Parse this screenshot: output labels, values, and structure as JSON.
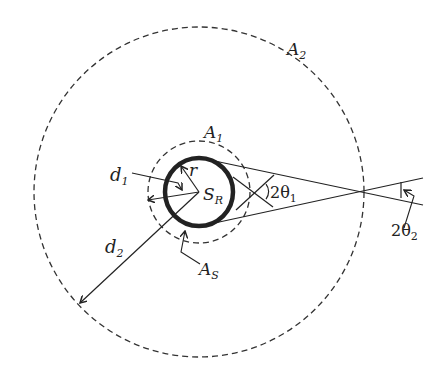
{
  "diagram": {
    "labels": {
      "A2": {
        "main": "A",
        "sub": "2"
      },
      "A1": {
        "main": "A",
        "sub": "1"
      },
      "AS": {
        "main": "A",
        "sub": "S"
      },
      "SR": {
        "main": "S",
        "sub": "R"
      },
      "r": {
        "main": "r"
      },
      "d1": {
        "main": "d",
        "sub": "1"
      },
      "d2": {
        "main": "d",
        "sub": "2"
      },
      "theta1": {
        "main": "2θ",
        "sub": "1"
      },
      "theta2": {
        "main": "2θ",
        "sub": "2"
      }
    },
    "geometry": {
      "center": [
        199,
        192
      ],
      "source_radius": 35,
      "A1_radius": 51,
      "A2_radius": 165
    },
    "colors": {
      "stroke": "#222222",
      "background": "#ffffff"
    }
  }
}
